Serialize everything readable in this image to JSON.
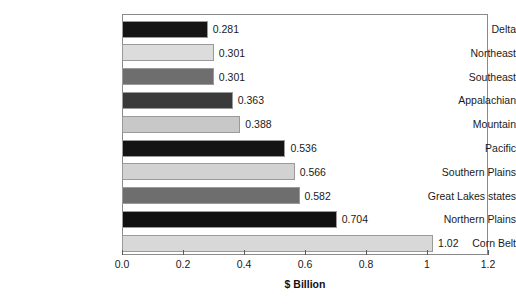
{
  "chart_data": {
    "type": "bar",
    "orientation": "horizontal",
    "title": "",
    "xlabel": "$ Billion",
    "ylabel": "",
    "xlim": [
      0.0,
      1.2
    ],
    "xticks": [
      0.0,
      0.2,
      0.4,
      0.6,
      0.8,
      1.0,
      1.2
    ],
    "xtick_labels": [
      "0.0",
      "0.2",
      "0.4",
      "0.6",
      "0.8",
      "1",
      "1.2"
    ],
    "grid": false,
    "legend": "none",
    "categories": [
      "Delta",
      "Northeast",
      "Southeast",
      "Appalachian",
      "Mountain",
      "Pacific",
      "Southern Plains",
      "Great Lakes states",
      "Northern Plains",
      "Corn Belt"
    ],
    "values": [
      0.281,
      0.301,
      0.301,
      0.363,
      0.388,
      0.536,
      0.566,
      0.582,
      0.704,
      1.02
    ],
    "value_labels": [
      "0.281",
      "0.301",
      "0.301",
      "0.363",
      "0.388",
      "0.536",
      "0.566",
      "0.582",
      "0.704",
      "1.02"
    ],
    "bar_colors": [
      "#141414",
      "#dcdcdc",
      "#6e6e6e",
      "#3a3a3a",
      "#c8c8c8",
      "#141414",
      "#d2d2d2",
      "#6e6e6e",
      "#101010",
      "#d8d8d8"
    ],
    "bar_border_color": "#9a9a9a",
    "frame_color": "#8a8a8a",
    "text_color": "#1a1a1a"
  }
}
